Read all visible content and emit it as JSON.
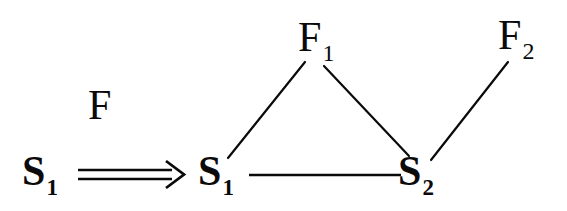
{
  "figure": {
    "background_color": "#ffffff",
    "ink_color": "#0a0a0a"
  },
  "source": {
    "node_base": "S",
    "node_subscript": "1",
    "node_text": "S1"
  },
  "relation": {
    "symbol_name": "double-right-arrow",
    "symbol": "⟹",
    "label_text": "F"
  },
  "graph": {
    "nodes": [
      {
        "id": "s1",
        "base": "S",
        "subscript": "1",
        "text": "S1",
        "x": 222,
        "y": 172,
        "kind": "s-node"
      },
      {
        "id": "s2",
        "base": "S",
        "subscript": "2",
        "text": "S2",
        "x": 422,
        "y": 172,
        "kind": "s-node"
      },
      {
        "id": "f1",
        "base": "F",
        "subscript": "1",
        "text": "F1",
        "x": 316,
        "y": 40,
        "kind": "f-node"
      },
      {
        "id": "f2",
        "base": "F",
        "subscript": "2",
        "text": "F2",
        "x": 518,
        "y": 38,
        "kind": "f-node"
      }
    ],
    "edges": [
      {
        "id": "e-s1-f1",
        "from": "s1",
        "to": "f1",
        "x1": 228,
        "y1": 158,
        "x2": 305,
        "y2": 62
      },
      {
        "id": "e-f1-s2",
        "from": "f1",
        "to": "s2",
        "x1": 324,
        "y1": 66,
        "x2": 409,
        "y2": 156
      },
      {
        "id": "e-s1-s2",
        "from": "s1",
        "to": "s2",
        "x1": 249,
        "y1": 175,
        "x2": 401,
        "y2": 175
      },
      {
        "id": "e-s2-f2",
        "from": "s2",
        "to": "f2",
        "x1": 431,
        "y1": 160,
        "x2": 508,
        "y2": 62
      }
    ]
  },
  "arrow": {
    "top_line_y": 170,
    "bottom_line_y": 179,
    "x_start": 78,
    "x_end": 168,
    "head_tip_x": 182,
    "head_top_y": 162,
    "head_bottom_y": 188
  }
}
